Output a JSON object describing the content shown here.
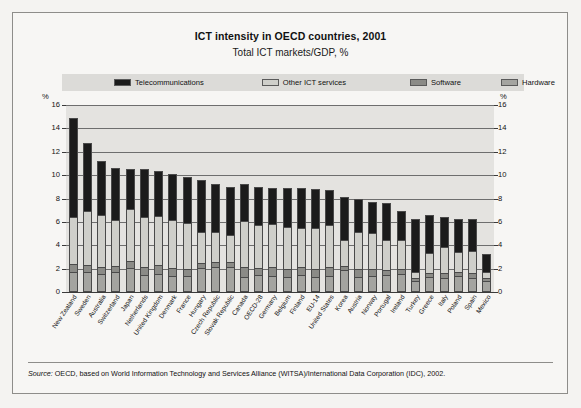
{
  "figure": {
    "title": "ICT intensity in OECD countries, 2001",
    "subtitle": "Total ICT markets/GDP, %",
    "axis_unit_left": "%",
    "axis_unit_right": "%",
    "source_label": "Source:",
    "source_text": "OECD, based on World Information Technology and Services Alliance (WITSA)/International Data Corporation (IDC), 2002."
  },
  "legend": {
    "items": [
      {
        "label": "Telecommunications",
        "color": "#1b1b1b"
      },
      {
        "label": "Other ICT services",
        "color": "#cfcfca"
      },
      {
        "label": "Software",
        "color": "#8b8b87"
      },
      {
        "label": "Hardware",
        "color": "#a4a4a0"
      }
    ]
  },
  "chart_data": {
    "type": "bar",
    "stacked": true,
    "title": "ICT intensity in OECD countries, 2001",
    "subtitle": "Total ICT markets/GDP, %",
    "xlabel": "",
    "ylabel": "%",
    "ylim": [
      0,
      16
    ],
    "yticks": [
      0,
      2,
      4,
      6,
      8,
      10,
      12,
      14,
      16
    ],
    "grid": true,
    "legend_position": "top",
    "dual_axis": true,
    "categories": [
      "New Zealand",
      "Sweden",
      "Australia",
      "Switzerland",
      "Japan",
      "Netherlands",
      "United Kingdom",
      "Denmark",
      "France",
      "Hungary",
      "Czech Republic",
      "Slovak Republic",
      "Canada",
      "OECD-28",
      "Germany",
      "Belgium",
      "Finland",
      "EU-14",
      "United States",
      "Korea",
      "Austria",
      "Norway",
      "Portugal",
      "Ireland",
      "Turkey",
      "Greece",
      "Italy",
      "Poland",
      "Spain",
      "Mexico"
    ],
    "series": [
      {
        "name": "Hardware",
        "color": "#a4a4a0",
        "values": [
          1.55,
          1.5,
          1.35,
          1.5,
          1.85,
          1.25,
          1.35,
          1.2,
          1.2,
          1.9,
          2.0,
          2.0,
          1.15,
          1.25,
          1.2,
          1.15,
          1.3,
          1.15,
          1.2,
          1.7,
          1.15,
          1.2,
          1.25,
          1.35,
          0.75,
          1.15,
          1.0,
          1.2,
          1.05,
          0.75
        ]
      },
      {
        "name": "Software",
        "color": "#8b8b87",
        "values": [
          0.55,
          0.55,
          0.55,
          0.5,
          0.55,
          0.6,
          0.7,
          0.6,
          0.55,
          0.35,
          0.35,
          0.3,
          0.7,
          0.55,
          0.65,
          0.55,
          0.55,
          0.55,
          0.65,
          0.25,
          0.55,
          0.55,
          0.35,
          0.4,
          0.15,
          0.25,
          0.4,
          0.25,
          0.35,
          0.15
        ]
      },
      {
        "name": "Other ICT services",
        "color": "#cfcfca",
        "values": [
          3.95,
          4.55,
          4.35,
          3.85,
          4.35,
          4.25,
          4.1,
          4.05,
          3.85,
          2.55,
          2.45,
          2.25,
          3.85,
          3.55,
          3.6,
          3.5,
          3.3,
          3.45,
          3.55,
          2.15,
          3.1,
          2.95,
          2.5,
          2.35,
          0.5,
          1.6,
          2.1,
          1.6,
          1.8,
          0.45
        ]
      },
      {
        "name": "Telecommunications",
        "color": "#1b1b1b",
        "values": [
          8.45,
          5.7,
          4.55,
          4.35,
          3.35,
          4.0,
          3.75,
          3.85,
          3.8,
          4.4,
          4.0,
          4.05,
          3.1,
          3.25,
          3.05,
          3.3,
          3.35,
          3.25,
          2.9,
          3.6,
          2.7,
          2.6,
          3.1,
          2.4,
          4.4,
          3.2,
          2.5,
          2.75,
          2.6,
          1.45
        ]
      }
    ],
    "totals": [
      14.5,
      12.3,
      10.8,
      10.2,
      10.1,
      10.1,
      9.9,
      9.7,
      9.4,
      9.2,
      8.8,
      8.6,
      8.8,
      8.6,
      8.5,
      8.5,
      8.5,
      8.4,
      8.3,
      7.7,
      7.5,
      7.3,
      7.2,
      6.5,
      5.8,
      6.2,
      6.0,
      5.8,
      5.8,
      2.8
    ],
    "stack_order_bottom_to_top": [
      "Hardware",
      "Software",
      "Other ICT services",
      "Telecommunications"
    ]
  }
}
